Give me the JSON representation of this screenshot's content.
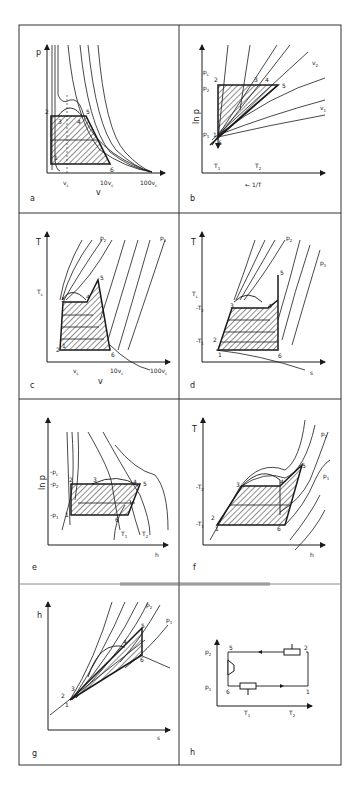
{
  "figure": {
    "panels": [
      {
        "id": "a",
        "label": "a",
        "x_axis": "v",
        "y_axis": "p",
        "x_ticks": [
          "v",
          "10v",
          "100v"
        ],
        "x_tick_sub": "c",
        "points": [
          "1",
          "2",
          "3",
          "4",
          "5",
          "6"
        ]
      },
      {
        "id": "b",
        "label": "b",
        "x_axis": "1/T",
        "x_axis_arrow": "←",
        "y_axis": "ln p",
        "y_ticks": [
          "p",
          "p",
          "p"
        ],
        "y_tick_subs": [
          "c",
          "2",
          "1"
        ],
        "x_ticks": [
          "T",
          "T"
        ],
        "x_tick_subs": [
          "1",
          "2"
        ],
        "curve_labels": [
          "v",
          "v"
        ],
        "curve_label_subs": [
          "2",
          "1"
        ],
        "points": [
          "1",
          "2",
          "3",
          "4",
          "5",
          "6"
        ]
      },
      {
        "id": "c",
        "label": "c",
        "x_axis": "v",
        "y_axis": "T",
        "y_ticks": [
          "T"
        ],
        "y_tick_subs": [
          "c"
        ],
        "x_ticks": [
          "v",
          "10v",
          "100v"
        ],
        "x_tick_sub": "c",
        "curve_labels": [
          "p",
          "p"
        ],
        "curve_label_subs": [
          "2",
          "1"
        ],
        "points": [
          "1",
          "2",
          "3",
          "4",
          "5",
          "6"
        ]
      },
      {
        "id": "d",
        "label": "d",
        "x_axis": "s",
        "y_axis": "T",
        "y_ticks": [
          "T",
          "T",
          "T"
        ],
        "y_tick_subs": [
          "c",
          "2",
          "1"
        ],
        "curve_labels": [
          "p",
          "p"
        ],
        "curve_label_subs": [
          "2",
          "1"
        ],
        "points": [
          "1",
          "2",
          "3",
          "4",
          "5",
          "6"
        ]
      },
      {
        "id": "e",
        "label": "e",
        "x_axis": "h",
        "y_axis": "ln p",
        "y_ticks": [
          "p",
          "p",
          "p"
        ],
        "y_tick_subs": [
          "c",
          "2",
          "1"
        ],
        "curve_labels": [
          "T",
          "T"
        ],
        "curve_label_subs": [
          "1",
          "2"
        ],
        "points": [
          "1",
          "2",
          "3",
          "4",
          "5",
          "6"
        ]
      },
      {
        "id": "f",
        "label": "f",
        "x_axis": "h",
        "y_axis": "T",
        "y_ticks": [
          "T",
          "T"
        ],
        "y_tick_subs": [
          "2",
          "1"
        ],
        "curve_labels": [
          "p",
          "p"
        ],
        "curve_label_subs": [
          "2",
          "1"
        ],
        "points": [
          "1",
          "2",
          "3",
          "4",
          "5",
          "6"
        ]
      },
      {
        "id": "g",
        "label": "g",
        "x_axis": "s",
        "y_axis": "h",
        "curve_labels": [
          "p",
          "p"
        ],
        "curve_label_subs": [
          "2",
          "1"
        ],
        "points": [
          "1",
          "2",
          "3",
          "4",
          "5",
          "6"
        ]
      },
      {
        "id": "h",
        "label": "h",
        "y_ticks": [
          "p",
          "p"
        ],
        "y_tick_subs": [
          "2",
          "1"
        ],
        "x_ticks": [
          "T",
          "T"
        ],
        "x_tick_subs": [
          "1",
          "2"
        ],
        "points": [
          "1",
          "2",
          "5",
          "6"
        ]
      }
    ]
  }
}
